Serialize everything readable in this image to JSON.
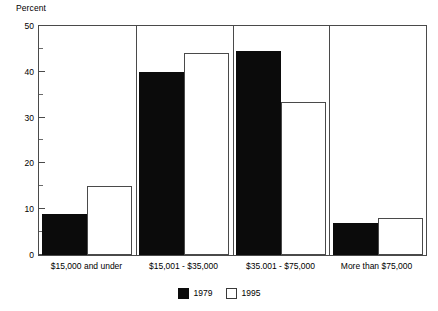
{
  "chart_data": {
    "type": "bar",
    "title": "",
    "xlabel": "",
    "ylabel": "Percent",
    "ylim": [
      0,
      50
    ],
    "ytick_step": 10,
    "yminor_step": 5,
    "ytick_labels": [
      "0",
      "10",
      "20",
      "30",
      "40",
      "50"
    ],
    "grid": false,
    "legend_position": "bottom-center",
    "categories": [
      "$15,000 and under",
      "$15,001 - $35,000",
      "$35.001 - $75,000",
      "More than $75,000"
    ],
    "series": [
      {
        "name": "1979",
        "color": "#0b0b0b",
        "values": [
          9,
          40,
          44.5,
          7
        ]
      },
      {
        "name": "1995",
        "color": "#ffffff",
        "values": [
          15,
          44,
          33.5,
          8
        ]
      }
    ]
  },
  "axis": {
    "title": "Percent"
  },
  "legend": {
    "entries": [
      {
        "label": "1979",
        "swatch": "filled-black-square"
      },
      {
        "label": "1995",
        "swatch": "outlined-white-square"
      }
    ]
  }
}
